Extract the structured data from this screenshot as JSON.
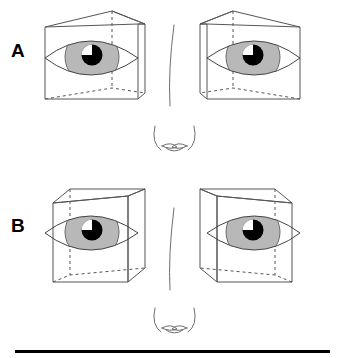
{
  "figure": {
    "title": "",
    "panels": [
      {
        "id": "A",
        "label": "A",
        "description": "Pair of eyes each enclosed in a trapezoidal wireframe box, mirror-symmetric about the nose",
        "box_shape": "trapezoid-prism",
        "eyes": [
          {
            "side": "left",
            "iris_color": "#b8b8b8",
            "pupil_color": "#000000",
            "highlight_color": "#ffffff"
          },
          {
            "side": "right",
            "iris_color": "#b8b8b8",
            "pupil_color": "#000000",
            "highlight_color": "#ffffff"
          }
        ]
      },
      {
        "id": "B",
        "label": "B",
        "description": "Pair of eyes each enclosed in a cuboid wireframe box, mirror-symmetric about the nose",
        "box_shape": "cuboid",
        "eyes": [
          {
            "side": "left",
            "iris_color": "#b8b8b8",
            "pupil_color": "#000000",
            "highlight_color": "#ffffff"
          },
          {
            "side": "right",
            "iris_color": "#b8b8b8",
            "pupil_color": "#000000",
            "highlight_color": "#ffffff"
          }
        ]
      }
    ],
    "nose": {
      "name": "nose",
      "count": 2,
      "description": "Bridge line with two nostril wings below"
    },
    "rule": {
      "name": "bottom-rule",
      "color": "#000000",
      "thickness_px": 3
    },
    "colors": {
      "stroke": "#4d4d4d",
      "iris": "#b8b8b8",
      "pupil": "#000000",
      "background": "#ffffff",
      "label": "#000000",
      "rule": "#000000"
    }
  }
}
